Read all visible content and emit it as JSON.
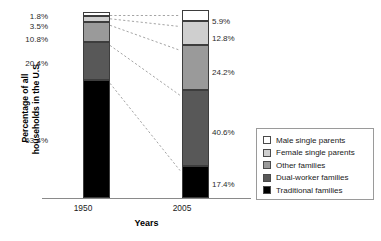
{
  "chart_data": {
    "type": "bar",
    "subtype": "stacked-bar-100-percent",
    "title": "",
    "xlabel": "Years",
    "ylabel": "Percentage of all households in the U.S.",
    "ylabel_lines": [
      "Percentage of all",
      "households in the U.S."
    ],
    "categories": [
      "1950",
      "2005"
    ],
    "ylim": [
      0,
      100
    ],
    "grid": false,
    "legend_position": "right",
    "stack_order_bottom_to_top": [
      "Traditional families",
      "Dual-worker families",
      "Other families",
      "Female single parents",
      "Male single parents"
    ],
    "series": [
      {
        "name": "Male single parents",
        "color": "#ffffff",
        "values": [
          1.8,
          5.9
        ]
      },
      {
        "name": "Female single parents",
        "color": "#cfcfcf",
        "values": [
          3.5,
          12.8
        ]
      },
      {
        "name": "Other families",
        "color": "#9a9a9a",
        "values": [
          10.8,
          24.2
        ]
      },
      {
        "name": "Dual-worker families",
        "color": "#585858",
        "values": [
          20.4,
          40.6
        ]
      },
      {
        "name": "Traditional families",
        "color": "#000000",
        "values": [
          63.4,
          17.4
        ]
      }
    ],
    "data_labels": {
      "1950": [
        "1.8%",
        "3.5%",
        "10.8%",
        "20.4%",
        "63.4%"
      ],
      "2005": [
        "5.9%",
        "12.8%",
        "24.2%",
        "40.6%",
        "17.4%"
      ]
    },
    "connector_lines": {
      "style": "dashed",
      "color": "#9a9a9a",
      "description": "Dashed lines link each segment boundary of the 1950 bar to the corresponding boundary of the 2005 bar"
    }
  },
  "axes": {
    "y_title_line1": "Percentage of all",
    "y_title_line2": "households in the U.S.",
    "x_title": "Years",
    "x_ticks": [
      "1950",
      "2005"
    ]
  },
  "labels_1950": {
    "male_single": "1.8%",
    "female_single": "3.5%",
    "other": "10.8%",
    "dual_worker": "20.4%",
    "traditional": "63.4%"
  },
  "labels_2005": {
    "male_single": "5.9%",
    "female_single": "12.8%",
    "other": "24.2%",
    "dual_worker": "40.6%",
    "traditional": "17.4%"
  },
  "legend": {
    "items": [
      {
        "label": "Male single parents",
        "color": "#ffffff"
      },
      {
        "label": "Female single parents",
        "color": "#cfcfcf"
      },
      {
        "label": "Other families",
        "color": "#9a9a9a"
      },
      {
        "label": "Dual-worker families",
        "color": "#585858"
      },
      {
        "label": "Traditional families",
        "color": "#000000"
      }
    ]
  }
}
